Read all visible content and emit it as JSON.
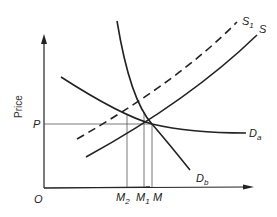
{
  "diagram": {
    "axis": {
      "y_label": "Price",
      "origin": "O"
    },
    "price_level": {
      "label": "P"
    },
    "quantity_marks": [
      {
        "main": "M",
        "sub": "2"
      },
      {
        "main": "M",
        "sub": "1"
      },
      {
        "main": "M",
        "sub": ""
      }
    ],
    "curves": [
      {
        "name": "S",
        "main": "S",
        "sub": "",
        "style": "solid"
      },
      {
        "name": "S1",
        "main": "S",
        "sub": "1",
        "style": "dashed"
      },
      {
        "name": "Da",
        "main": "D",
        "sub": "a",
        "style": "solid"
      },
      {
        "name": "Db",
        "main": "D",
        "sub": "b",
        "style": "solid"
      }
    ],
    "colors": {
      "line": "#222222",
      "guide": "#555555",
      "background": "#ffffff"
    }
  }
}
